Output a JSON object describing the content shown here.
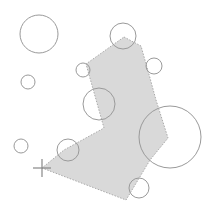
{
  "diagram": {
    "width": 211,
    "height": 215,
    "background": "#ffffff",
    "polygon": {
      "fill": "#d9d9d9",
      "stroke": "#aaaaaa",
      "points": [
        [
          124,
          37
        ],
        [
          141,
          46
        ],
        [
          150,
          78
        ],
        [
          156,
          100
        ],
        [
          168,
          138
        ],
        [
          150,
          160
        ],
        [
          126,
          200
        ],
        [
          42,
          168
        ],
        [
          64,
          150
        ],
        [
          104,
          128
        ],
        [
          86,
          64
        ]
      ]
    },
    "circle_stroke": "#9a9a9a",
    "circles": [
      {
        "cx": 39,
        "cy": 34,
        "r": 19
      },
      {
        "cx": 28,
        "cy": 82,
        "r": 7
      },
      {
        "cx": 21,
        "cy": 146,
        "r": 7
      },
      {
        "cx": 123,
        "cy": 36,
        "r": 13
      },
      {
        "cx": 83,
        "cy": 70,
        "r": 7
      },
      {
        "cx": 154,
        "cy": 66,
        "r": 8
      },
      {
        "cx": 99,
        "cy": 104,
        "r": 16
      },
      {
        "cx": 68,
        "cy": 150,
        "r": 11
      },
      {
        "cx": 170,
        "cy": 137,
        "r": 31
      },
      {
        "cx": 139,
        "cy": 188,
        "r": 10
      }
    ],
    "crosshair": {
      "x": 42,
      "y": 168,
      "size": 9,
      "color": "#888888"
    }
  }
}
